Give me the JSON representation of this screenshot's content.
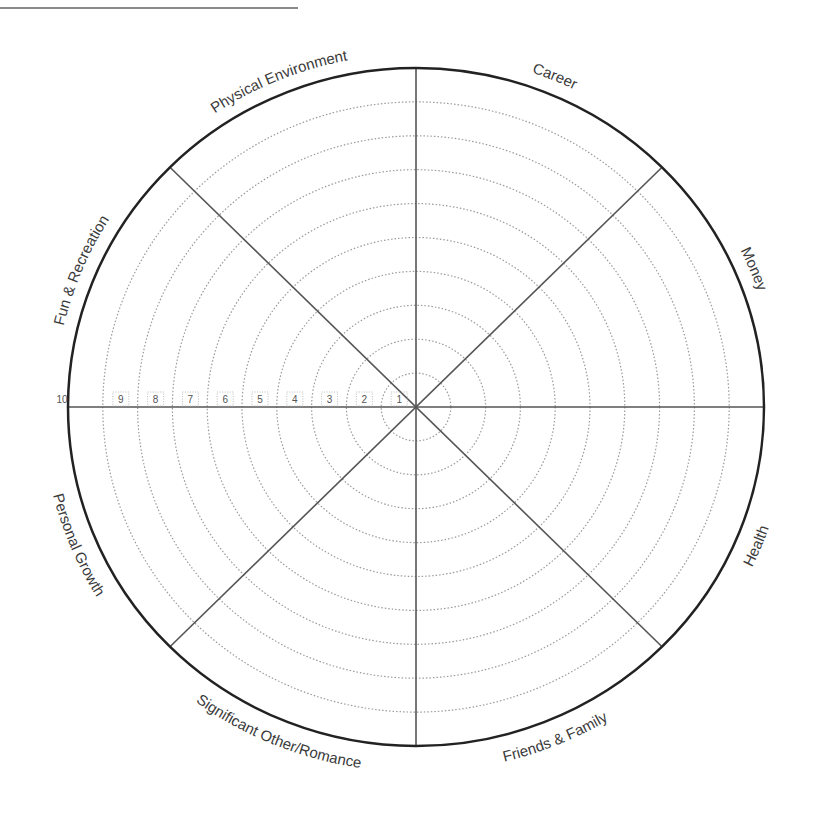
{
  "diagram": {
    "center": {
      "x": 416,
      "y": 407
    },
    "radius": {
      "rx": 348,
      "ry": 339
    },
    "colors": {
      "outer": "#222222",
      "spokes": "#555555",
      "rings": "#9a9a9a",
      "text": "#3a3a3a"
    },
    "segments": [
      {
        "label": "Career",
        "angle_deg": 22.5
      },
      {
        "label": "Money",
        "angle_deg": 67.5
      },
      {
        "label": "Health",
        "angle_deg": 112.5
      },
      {
        "label": "Friends & Family",
        "angle_deg": 157.5
      },
      {
        "label": "Significant Other/Romance",
        "angle_deg": 202.5
      },
      {
        "label": "Personal Growth",
        "angle_deg": 247.5
      },
      {
        "label": "Fun & Recreation",
        "angle_deg": 292.5
      },
      {
        "label": "Physical Environment",
        "angle_deg": 337.5
      }
    ],
    "scale": {
      "ticks": [
        "1",
        "2",
        "3",
        "4",
        "5",
        "6",
        "7",
        "8",
        "9",
        "10"
      ],
      "rings": 10
    }
  }
}
